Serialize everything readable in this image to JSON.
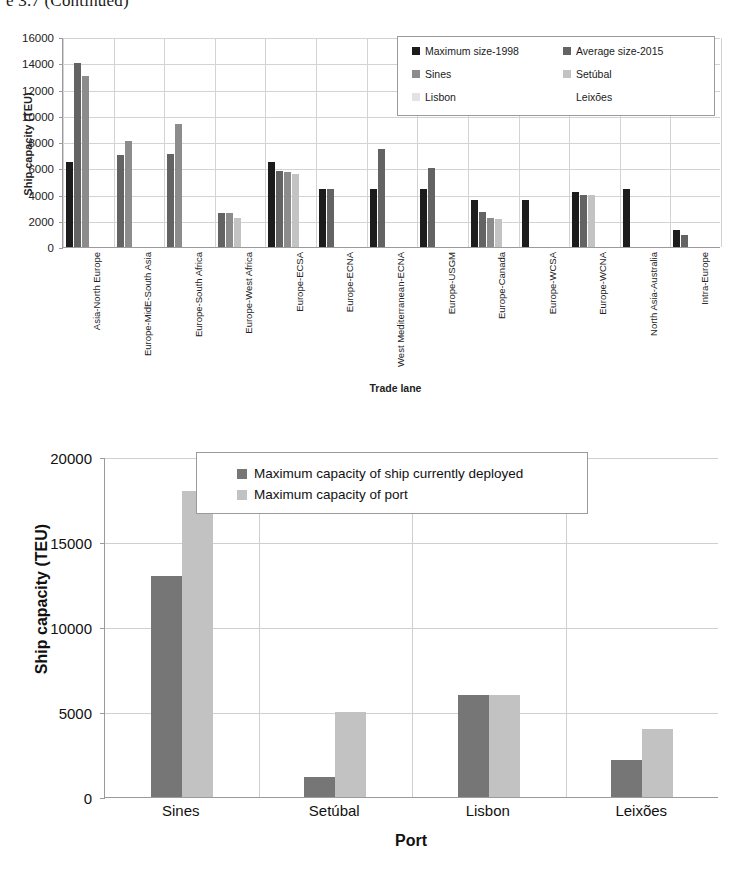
{
  "caption": "e 3.7  (Continued)",
  "chart_data": [
    {
      "type": "bar",
      "id": "trade-lane-ship-capacity",
      "title": "",
      "xlabel": "Trade lane",
      "ylabel": "Ship capacity (TEU)",
      "ylim": [
        0,
        16000
      ],
      "ytick_step": 2000,
      "yticks": [
        "16000",
        "14000",
        "12000",
        "10000",
        "8000",
        "6000",
        "4000",
        "2000",
        "0"
      ],
      "grid": true,
      "legend_position": "top-right",
      "categories": [
        "Asia-North Europe",
        "Europe-MidE-South Asia",
        "Europe-South Africa",
        "Europe-West Africa",
        "Europe-ECSA",
        "Europe-ECNA",
        "West Mediterranean-ECNA",
        "Europe-USGM",
        "Europe-Canada",
        "Europe-WCSA",
        "Europe-WCNA",
        "North Asia-Australia",
        "Intra-Europe"
      ],
      "series": [
        {
          "name": "Maximum size-1998",
          "color": "#1c1c1c",
          "values": [
            6500,
            null,
            null,
            null,
            6500,
            4400,
            4400,
            4400,
            3600,
            3600,
            4200,
            4400,
            1300
          ]
        },
        {
          "name": "Average size-2015",
          "color": "#636363",
          "values": [
            14000,
            7000,
            7100,
            2600,
            5800,
            4400,
            7500,
            6000,
            2700,
            null,
            4000,
            null,
            900
          ]
        },
        {
          "name": "Sines",
          "color": "#8c8c8c",
          "values": [
            13000,
            8100,
            9400,
            2600,
            5700,
            null,
            null,
            null,
            2200,
            null,
            null,
            null,
            null
          ]
        },
        {
          "name": "Setúbal",
          "color": "#c3c3c3",
          "values": [
            null,
            null,
            null,
            2200,
            5600,
            null,
            null,
            null,
            2100,
            null,
            4000,
            null,
            null
          ]
        },
        {
          "name": "Lisbon",
          "color": "#e3e3e3",
          "values": [
            null,
            null,
            null,
            null,
            null,
            null,
            null,
            null,
            null,
            null,
            null,
            null,
            null
          ]
        },
        {
          "name": "Leixões",
          "color": "#ffffff",
          "values": [
            null,
            null,
            null,
            null,
            null,
            null,
            null,
            null,
            null,
            null,
            null,
            null,
            null
          ]
        }
      ]
    },
    {
      "type": "bar",
      "id": "port-capacity-comparison",
      "title": "",
      "xlabel": "Port",
      "ylabel": "Ship capacity (TEU)",
      "ylim": [
        0,
        20000
      ],
      "ytick_step": 5000,
      "yticks": [
        "20000",
        "15000",
        "10000",
        "5000",
        "0"
      ],
      "grid": true,
      "legend_position": "top-center",
      "categories": [
        "Sines",
        "Setúbal",
        "Lisbon",
        "Leixões"
      ],
      "series": [
        {
          "name": "Maximum capacity of ship currently deployed",
          "color": "#767676",
          "values": [
            13000,
            1200,
            6000,
            2200
          ]
        },
        {
          "name": "Maximum capacity of port",
          "color": "#c2c2c2",
          "values": [
            18000,
            5000,
            6000,
            4000
          ]
        }
      ]
    }
  ]
}
